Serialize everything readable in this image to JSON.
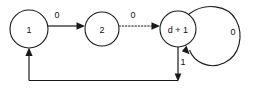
{
  "diagram": {
    "type": "state-transition-diagram",
    "background_color": "#ffffff",
    "stroke_color": "#1a1a1a",
    "text_color": "#111111",
    "nodes": [
      {
        "id": "state-1",
        "label": "1",
        "cx": 29,
        "cy": 29,
        "r": 19
      },
      {
        "id": "state-2",
        "label": "2",
        "cx": 102,
        "cy": 29,
        "r": 17
      },
      {
        "id": "state-d-plus-1",
        "label": "d + 1",
        "cx": 178,
        "cy": 29,
        "r": 18
      }
    ],
    "edges": [
      {
        "id": "edge-1-to-2",
        "from": "state-1",
        "to": "state-2",
        "label": "0",
        "style": "solid",
        "label_x": 57,
        "label_y": 15
      },
      {
        "id": "edge-2-to-d-plus-1",
        "from": "state-2",
        "to": "state-d-plus-1",
        "label": "0",
        "style": "dotted",
        "label_x": 133,
        "label_y": 15
      },
      {
        "id": "edge-self-loop-d-plus-1",
        "from": "state-d-plus-1",
        "to": "state-d-plus-1",
        "label": "0",
        "style": "solid",
        "label_x": 233,
        "label_y": 32
      },
      {
        "id": "edge-d-plus-1-to-1",
        "from": "state-d-plus-1",
        "to": "state-1",
        "label": "1",
        "style": "solid",
        "label_x": 183,
        "label_y": 62
      }
    ]
  }
}
